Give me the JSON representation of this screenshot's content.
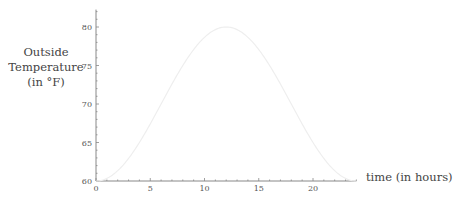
{
  "chart_data": {
    "type": "line",
    "title": "",
    "xlabel": "time (in hours)",
    "ylabel": [
      "Outside",
      "Temperature",
      "(in °F)"
    ],
    "xlim": [
      0,
      24
    ],
    "ylim": [
      60,
      82
    ],
    "x_ticks": [
      0,
      5,
      10,
      15,
      20
    ],
    "y_ticks": [
      60,
      65,
      70,
      75,
      80
    ],
    "grid": false,
    "legend": null,
    "series": [
      {
        "name": "Outside Temperature",
        "color": "#eeeeee",
        "x": [
          0,
          1,
          2,
          3,
          4,
          5,
          6,
          7,
          8,
          9,
          10,
          11,
          12,
          13,
          14,
          15,
          16,
          17,
          18,
          19,
          20,
          21,
          22,
          23,
          24
        ],
        "values": [
          60,
          60.3,
          61.3,
          62.9,
          65,
          67.4,
          70,
          72.6,
          75,
          77.1,
          78.7,
          79.7,
          80,
          79.7,
          78.7,
          77.1,
          75,
          72.6,
          70,
          67.4,
          65,
          62.9,
          61.3,
          60.3,
          60
        ]
      }
    ]
  }
}
